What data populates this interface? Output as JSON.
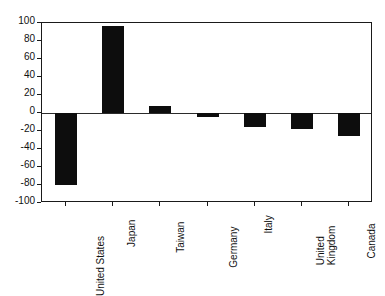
{
  "chart_data": {
    "type": "bar",
    "title": "",
    "subtitle": "",
    "xlabel": "",
    "ylabel": "",
    "categories": [
      "United States",
      "Japan",
      "Taiwan",
      "Germany",
      "Italy",
      "United Kingdom",
      "Canada"
    ],
    "category_lines": [
      [
        "United States"
      ],
      [
        "Japan"
      ],
      [
        "Taiwan"
      ],
      [
        "Germany"
      ],
      [
        "Italy"
      ],
      [
        "United",
        "Kingdom"
      ],
      [
        "Canada"
      ]
    ],
    "values": [
      -80,
      97,
      8,
      -4,
      -15,
      -18,
      -26
    ],
    "ylim": [
      -100,
      100
    ],
    "ytick_values": [
      100,
      80,
      60,
      40,
      20,
      0,
      -20,
      -40,
      -60,
      -80,
      -100
    ],
    "ytick_labels": [
      "100",
      "80",
      "60",
      "40",
      "20",
      "0",
      "-20",
      "-40",
      "-60",
      "-80",
      "-100"
    ],
    "grid": false,
    "legend": null,
    "legend_position": "none",
    "bar_color": "#0d0d0d",
    "axis_color": "#1a1a1a",
    "background_color": "#ffffff",
    "zero_line": 0,
    "orientation": "vertical"
  }
}
